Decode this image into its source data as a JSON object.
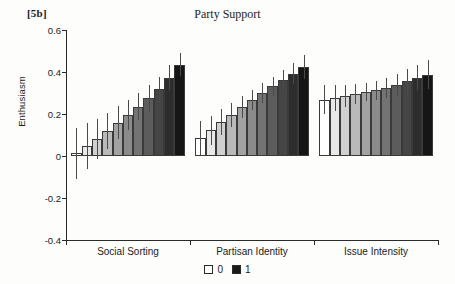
{
  "panel": {
    "label": "[5b]"
  },
  "chart_data": {
    "type": "bar",
    "title": "Party Support",
    "xlabel": "",
    "ylabel": "Enthusiasm",
    "ylim": [
      -0.4,
      0.6
    ],
    "yticks": [
      0.6,
      0.4,
      0.2,
      0,
      -0.2,
      -0.4
    ],
    "ytick_labels": [
      "0.6",
      "0.4",
      "0.2",
      "0",
      "-0.2",
      "-0.4"
    ],
    "grid": false,
    "legend_position": "bottom-center",
    "legend": [
      {
        "label": "0",
        "color": "#ffffff"
      },
      {
        "label": "1",
        "color": "#1a1a1a"
      }
    ],
    "note": "Within each group the 11 bars shade continuously from white (0) to black (1).",
    "categories": [
      "Social Sorting",
      "Partisan Identity",
      "Issue Intensity"
    ],
    "levels": [
      0,
      0.1,
      0.2,
      0.3,
      0.4,
      0.5,
      0.6,
      0.7,
      0.8,
      0.9,
      1
    ],
    "groups": [
      {
        "name": "Social Sorting",
        "values": [
          0.012,
          0.048,
          0.083,
          0.12,
          0.158,
          0.196,
          0.235,
          0.276,
          0.318,
          0.372,
          0.435
        ],
        "err_low": [
          -0.108,
          -0.062,
          -0.012,
          0.034,
          0.08,
          0.126,
          0.172,
          0.216,
          0.258,
          0.312,
          0.38
        ],
        "err_high": [
          0.132,
          0.158,
          0.178,
          0.206,
          0.236,
          0.266,
          0.298,
          0.336,
          0.378,
          0.432,
          0.492
        ]
      },
      {
        "name": "Partisan Identity",
        "values": [
          0.086,
          0.122,
          0.16,
          0.196,
          0.232,
          0.266,
          0.3,
          0.332,
          0.362,
          0.392,
          0.424
        ],
        "err_low": [
          0.006,
          0.052,
          0.098,
          0.14,
          0.18,
          0.218,
          0.254,
          0.286,
          0.314,
          0.342,
          0.368
        ],
        "err_high": [
          0.166,
          0.192,
          0.222,
          0.252,
          0.284,
          0.314,
          0.346,
          0.378,
          0.41,
          0.442,
          0.48
        ]
      },
      {
        "name": "Issue Intensity",
        "values": [
          0.268,
          0.274,
          0.286,
          0.296,
          0.304,
          0.312,
          0.324,
          0.34,
          0.356,
          0.372,
          0.388
        ],
        "err_low": [
          0.198,
          0.212,
          0.232,
          0.248,
          0.26,
          0.268,
          0.276,
          0.288,
          0.3,
          0.312,
          0.32
        ],
        "err_high": [
          0.338,
          0.336,
          0.34,
          0.344,
          0.348,
          0.356,
          0.372,
          0.392,
          0.412,
          0.432,
          0.456
        ]
      }
    ]
  }
}
